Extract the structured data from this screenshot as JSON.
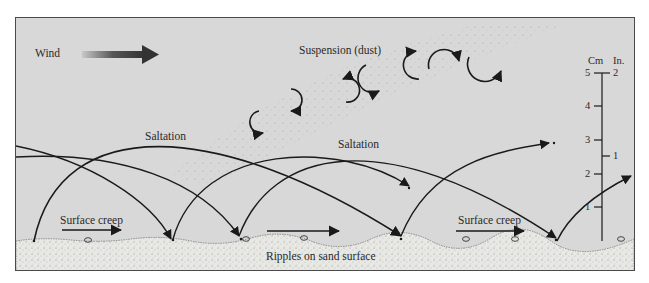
{
  "diagram": {
    "labels": {
      "wind": "Wind",
      "suspension": "Suspension (dust)",
      "saltation_1": "Saltation",
      "saltation_2": "Saltation",
      "surface_creep_1": "Surface creep",
      "surface_creep_2": "Surface creep",
      "ripples": "Ripples on sand surface"
    },
    "scale": {
      "cm_header": "Cm",
      "in_header": "In.",
      "cm_ticks": [
        "5",
        "4",
        "3",
        "2",
        "1"
      ],
      "in_ticks": [
        "2",
        "1"
      ]
    },
    "icons": {
      "wind_arrow": "wind-direction-arrow",
      "suspension_swirls": "curved-eddy-arrows",
      "saltation_paths": "arc-trajectory-arrows",
      "creep_arrows": "straight-right-arrows"
    },
    "colors": {
      "background": "#d8d8d8",
      "sand": "#e6e6e2",
      "lines": "#1a1a1a",
      "frame": "#4a4a4a"
    }
  }
}
